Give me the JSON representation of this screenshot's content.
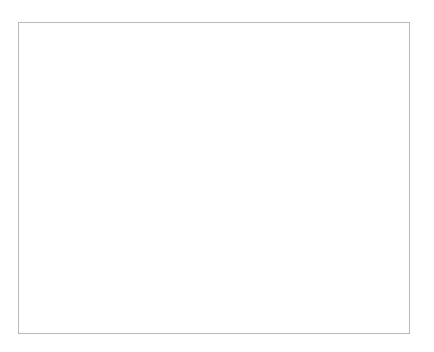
{
  "chart_data": {
    "type": "line",
    "title": "",
    "xlabel": "",
    "ylabel": "Weight (lbs.)",
    "ylim": [
      140,
      210
    ],
    "ytick_step": 10,
    "yticks": [
      "140",
      "150",
      "160",
      "170",
      "180",
      "190",
      "200",
      "210"
    ],
    "grid": true,
    "legend": false,
    "xticks": [
      "8/18/2011",
      "10/18/2011",
      "12/18/2011",
      "2/18/2012",
      "4/18/2012",
      "6/18/2012",
      "8/18/2012",
      "10/18/2012",
      "12/18/2012",
      "2/18/2013",
      "4/18/2013",
      "6/18/2013"
    ],
    "xtick_label_rotation_deg": -45,
    "marker": "diamond",
    "marker_color": "#1a1a1a",
    "line_color": "#5a5a5a",
    "series": [
      {
        "name": "Weight",
        "points": [
          {
            "x": "8/18/2011",
            "y": 200.2
          },
          {
            "x": "9/1/2011",
            "y": 203.0
          },
          {
            "x": "3/8/2012",
            "y": 171.7
          },
          {
            "x": "6/20/2012",
            "y": 165.2
          },
          {
            "x": "7/20/2012",
            "y": 159.7
          },
          {
            "x": "9/20/2012",
            "y": 149.8
          },
          {
            "x": "10/8/2012",
            "y": 146.2
          },
          {
            "x": "10/12/2012",
            "y": 151.8
          },
          {
            "x": "11/8/2012",
            "y": 148.4
          },
          {
            "x": "12/2/2012",
            "y": 151.5
          },
          {
            "x": "1/20/2013",
            "y": 149.4
          },
          {
            "x": "4/5/2013",
            "y": 149.1
          },
          {
            "x": "7/1/2013",
            "y": 151.7
          }
        ]
      }
    ]
  }
}
